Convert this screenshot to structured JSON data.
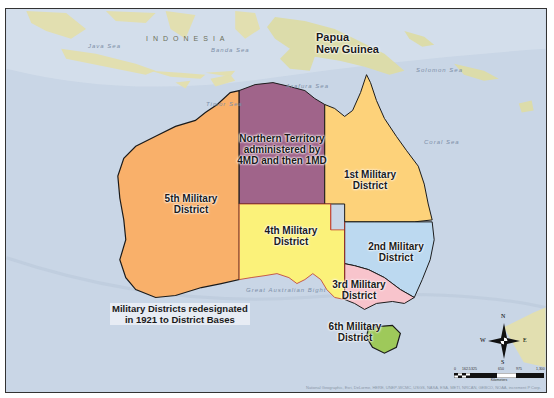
{
  "map": {
    "title": "Australian Military Districts",
    "colors": {
      "ocean": "#c9d6e6",
      "land_background": "#e6e2b8",
      "png_land": "#dcdcaa",
      "district_1": "#fdd27a",
      "district_2": "#bcd9f0",
      "district_3": "#f8c4cc",
      "district_4": "#fbf27a",
      "district_5": "#f9b06a",
      "district_6": "#9ec95a",
      "northern_territory": "#a0648a",
      "boundary": "#c0392b",
      "coastline": "#1a1a1a"
    },
    "region_labels": {
      "papua": "Papua",
      "new_guinea": "New Guinea",
      "indonesia": "INDONESIA"
    },
    "sea_labels": [
      "Java Sea",
      "Banda Sea",
      "Timor Sea",
      "Arafura Sea",
      "Coral Sea",
      "Solomon Sea",
      "Great Australian Bight"
    ],
    "districts": [
      {
        "id": "nt",
        "line1": "Northern Territory",
        "line2": "administered by",
        "line3": "4MD and then 1MD"
      },
      {
        "id": "1md",
        "line1": "1st Military",
        "line2": "District"
      },
      {
        "id": "2md",
        "line1": "2nd Military",
        "line2": "District"
      },
      {
        "id": "3md",
        "line1": "3rd Military",
        "line2": "District"
      },
      {
        "id": "4md",
        "line1": "4th Military",
        "line2": "District"
      },
      {
        "id": "5md",
        "line1": "5th Military",
        "line2": "District"
      },
      {
        "id": "6md",
        "line1": "6th Military",
        "line2": "District"
      }
    ],
    "note": {
      "line1": "Military Districts redesignated",
      "line2": "in 1921 to District Bases"
    },
    "compass": {
      "n": "N",
      "s": "S",
      "e": "E",
      "w": "W"
    },
    "scale": {
      "ticks": [
        "0",
        "162.5",
        "325",
        "650",
        "975",
        "1,300"
      ],
      "unit": "Kilometers"
    },
    "attribution": "National Geographic, Esri, DeLorme, HERE, UNEP-WCMC, USGS, NASA, ESA, METI, NRCAN, GEBCO, NOAA, increment P Corp."
  }
}
